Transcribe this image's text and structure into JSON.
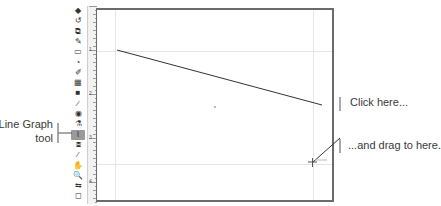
{
  "toolbar": {
    "tools": [
      {
        "name": "select-icon",
        "glyph": "◆"
      },
      {
        "name": "lasso-icon",
        "glyph": "↺"
      },
      {
        "name": "transform-icon",
        "glyph": "⧉"
      },
      {
        "name": "pen-icon",
        "glyph": "✎"
      },
      {
        "name": "rectangle-icon",
        "glyph": "▭"
      },
      {
        "name": "shape-icon",
        "glyph": "◔"
      },
      {
        "name": "brush-icon",
        "glyph": "✐"
      },
      {
        "name": "grid-icon",
        "glyph": "▦"
      },
      {
        "name": "gradient-icon",
        "glyph": "■"
      },
      {
        "name": "eyedropper-icon",
        "glyph": "⁄"
      },
      {
        "name": "paint-bucket-icon",
        "glyph": "◉"
      },
      {
        "name": "blend-icon",
        "glyph": "⚗"
      },
      {
        "name": "line-graph-icon",
        "glyph": "⌇",
        "active": true
      },
      {
        "name": "slice-icon",
        "glyph": "⧈"
      },
      {
        "name": "eraser-icon",
        "glyph": "⁄"
      },
      {
        "name": "hand-icon",
        "glyph": "✋"
      },
      {
        "name": "zoom-icon",
        "glyph": "🔍"
      },
      {
        "name": "swap-colors-icon",
        "glyph": "⇆"
      },
      {
        "name": "fill-stroke-icon",
        "glyph": "◻"
      }
    ]
  },
  "ruler": {
    "labels": [
      "1",
      "2",
      "3",
      "4"
    ]
  },
  "callouts": {
    "tool_label_line1": "Line Graph",
    "tool_label_line2": "tool",
    "click_here": "Click here...",
    "drag_here": "...and drag to here."
  },
  "canvas": {
    "graph_line": {
      "x1": 117,
      "y1": 50,
      "x2": 322,
      "y2": 105
    },
    "drag_cursor": {
      "x": 312,
      "y": 162
    },
    "border_color": "#6b6b6b",
    "guide_color": "#e6e6e6"
  }
}
